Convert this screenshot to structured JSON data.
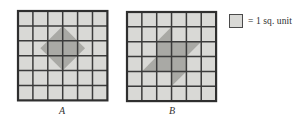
{
  "figure": {
    "width": 307,
    "height": 129,
    "background": "#ffffff",
    "colors": {
      "cell_fill": "#d9d9d6",
      "shape_fill": "#a9a9a5",
      "grid_line": "#3b3b3b",
      "border_line": "#2f2f2f",
      "text": "#2e2e2e"
    }
  },
  "legend": {
    "swatch_name": "unit-square-swatch",
    "swatch_color": "#d9d9d6",
    "text": "= 1 sq. unit"
  },
  "grids": [
    {
      "id": "A",
      "label": "A",
      "origin_x": 18,
      "origin_y": 11,
      "cols": 6,
      "rows": 6,
      "cell": 14.9,
      "label_x": 47,
      "label_y": 105,
      "shape_name": "diamond",
      "shape_description": "Shaded diamond (rotated square) centered in the grid",
      "shape_area_sq_units": 8,
      "polygons": [
        [
          [
            3,
            1
          ],
          [
            4.5,
            2.5
          ],
          [
            3,
            4
          ],
          [
            1.5,
            2.5
          ]
        ]
      ]
    },
    {
      "id": "B",
      "label": "B",
      "origin_x": 127,
      "origin_y": 12,
      "cols": 6,
      "rows": 6,
      "cell": 14.85,
      "label_x": 157,
      "label_y": 105,
      "shape_name": "pinwheel",
      "shape_description": "Shaded central square with four triangular fins forming a pinwheel",
      "shape_area_sq_units": 8,
      "polygons": [
        [
          [
            2,
            2
          ],
          [
            4,
            2
          ],
          [
            4,
            4
          ],
          [
            2,
            4
          ]
        ],
        [
          [
            2,
            2
          ],
          [
            3,
            1
          ],
          [
            3,
            2
          ]
        ],
        [
          [
            4,
            2
          ],
          [
            5,
            2
          ],
          [
            4,
            3
          ]
        ],
        [
          [
            4,
            4
          ],
          [
            3,
            5
          ],
          [
            3,
            4
          ]
        ],
        [
          [
            2,
            4
          ],
          [
            1,
            4
          ],
          [
            2,
            3
          ]
        ]
      ]
    }
  ]
}
